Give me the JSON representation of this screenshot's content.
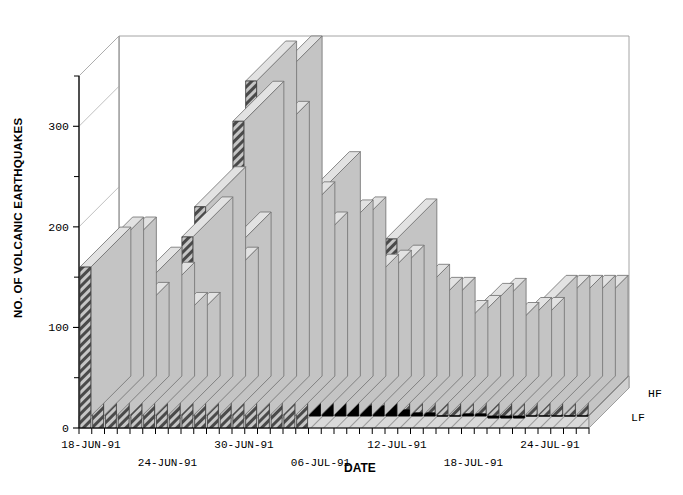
{
  "chart_data": {
    "type": "bar",
    "title": "",
    "subtitle": "",
    "xlabel": "DATE",
    "ylabel": "NO. OF VOLCANIC EARTHQUAKES",
    "ylim": [
      0,
      350
    ],
    "yticks_major": [
      0,
      100,
      200,
      300
    ],
    "yticks_minor": [
      50,
      150,
      250,
      350
    ],
    "grid": false,
    "stacked": true,
    "three_d": true,
    "legend": [
      "HF",
      "LF"
    ],
    "legend_position": "right-inside",
    "xtick_labels": [
      "18-JUN-91",
      "24-JUN-91",
      "30-JUN-91",
      "06-JUL-91",
      "12-JUL-91",
      "18-JUL-91",
      "24-JUL-91"
    ],
    "xtick_label_rows": [
      0,
      1,
      0,
      1,
      0,
      1,
      0
    ],
    "x_start_date": "18-JUN-91",
    "x_end_date": "28-JUL-91",
    "categories": [
      "18-JUN-91",
      "19-JUN-91",
      "20-JUN-91",
      "21-JUN-91",
      "22-JUN-91",
      "23-JUN-91",
      "24-JUN-91",
      "25-JUN-91",
      "26-JUN-91",
      "27-JUN-91",
      "28-JUN-91",
      "29-JUN-91",
      "30-JUN-91",
      "01-JUL-91",
      "02-JUL-91",
      "03-JUL-91",
      "04-JUL-91",
      "05-JUL-91",
      "06-JUL-91",
      "07-JUL-91",
      "08-JUL-91",
      "09-JUL-91",
      "10-JUL-91",
      "11-JUL-91",
      "12-JUL-91",
      "13-JUL-91",
      "14-JUL-91",
      "15-JUL-91",
      "16-JUL-91",
      "17-JUL-91",
      "18-JUL-91",
      "19-JUL-91",
      "20-JUL-91",
      "21-JUL-91",
      "22-JUL-91",
      "23-JUL-91",
      "24-JUL-91",
      "25-JUL-91",
      "26-JUL-91",
      "27-JUL-91"
    ],
    "series": [
      {
        "name": "HF",
        "fill": "hatch-diagonal",
        "color": "#b4b4b4",
        "values": [
          160,
          170,
          170,
          105,
          140,
          125,
          95,
          95,
          190,
          220,
          140,
          175,
          305,
          345,
          285,
          350,
          205,
          175,
          175,
          155,
          145,
          105,
          115,
          120,
          160,
          105,
          95,
          95,
          75,
          80,
          90,
          95,
          75,
          80,
          80,
          100,
          100,
          100,
          100,
          100
        ]
      },
      {
        "name": "LF",
        "fill": "solid-black",
        "color": "#000000",
        "values": [
          0,
          0,
          0,
          0,
          0,
          0,
          0,
          0,
          0,
          0,
          0,
          0,
          0,
          0,
          0,
          0,
          0,
          0,
          60,
          32,
          45,
          28,
          22,
          22,
          28,
          18,
          15,
          15,
          12,
          12,
          14,
          14,
          10,
          10,
          10,
          12,
          12,
          12,
          12,
          12
        ]
      }
    ]
  },
  "axes": {
    "y_tick_labels": [
      "0",
      "100",
      "200",
      "300"
    ],
    "x_axis_title": "DATE",
    "y_axis_title": "NO. OF VOLCANIC EARTHQUAKES"
  },
  "legend_items": [
    {
      "label": "HF",
      "swatch": "hatched"
    },
    {
      "label": "LF",
      "swatch": "black"
    }
  ]
}
